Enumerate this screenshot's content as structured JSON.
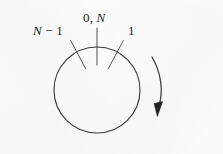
{
  "figure": {
    "kind": "circular-buffer-ring-diagram",
    "background_color": "#fdfdfd",
    "ink_color": "#3a3a3a",
    "text_color": "#1b1b1b",
    "circle": {
      "center_x": 97,
      "center_y": 90,
      "radius": 43,
      "stroke_width": 1.1
    },
    "ticks": [
      {
        "name": "tick-n-minus-1",
        "label": "N − 1",
        "angle_degrees": 118,
        "inner_radius": 24,
        "outer_radius": 56
      },
      {
        "name": "tick-zero-n",
        "label": "0, N",
        "angle_degrees": 90,
        "inner_radius": 25,
        "outer_radius": 62
      },
      {
        "name": "tick-one",
        "label": "1",
        "angle_degrees": 62,
        "inner_radius": 24,
        "outer_radius": 56
      }
    ],
    "labels": {
      "n_minus_1": {
        "prefix_italic": "N",
        "operator": " − ",
        "suffix": "1",
        "full_text": "N − 1"
      },
      "zero_n": {
        "prefix": "0, ",
        "italic": "N",
        "full_text": "0, N"
      },
      "one": {
        "full_text": "1"
      }
    },
    "direction_arrow": {
      "name": "clockwise-rotation-arrow",
      "orientation": "clockwise",
      "start_x": 152,
      "start_y": 57,
      "end_x": 159,
      "end_y": 113,
      "arrowhead": "filled-triangle-pointing-down"
    }
  }
}
